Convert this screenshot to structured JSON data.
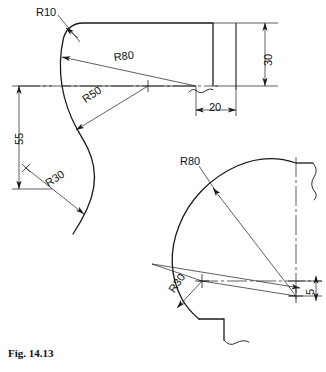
{
  "figure": {
    "caption": "Fig. 14.13",
    "caption_pos": {
      "x": 8,
      "y": 347
    }
  },
  "upper_view": {
    "name": "upper-profile-view",
    "labels": [
      {
        "id": "r10",
        "text": "R10",
        "x": 36,
        "y": 6,
        "rotation": 0
      },
      {
        "id": "r80",
        "text": "R80",
        "x": 113,
        "y": 51,
        "rotation": -7
      },
      {
        "id": "r50",
        "text": "R50",
        "x": 80,
        "y": 95,
        "rotation": -34
      },
      {
        "id": "r30",
        "text": "R30",
        "x": 43,
        "y": 179,
        "rotation": -34
      },
      {
        "id": "dim55",
        "text": "55",
        "x": 13,
        "y": 137,
        "rotation": -90
      },
      {
        "id": "dim30",
        "text": "30",
        "x": 262,
        "y": 66,
        "rotation": -90
      },
      {
        "id": "dim20",
        "text": "20",
        "x": 211,
        "y": 99,
        "rotation": 0
      }
    ]
  },
  "lower_view": {
    "name": "lower-quadrant-view",
    "labels": [
      {
        "id": "r80b",
        "text": "R80",
        "x": 180,
        "y": 155,
        "rotation": 0
      },
      {
        "id": "r30b",
        "text": "R30",
        "x": 168,
        "y": 285,
        "rotation": -56
      },
      {
        "id": "dim5",
        "text": "5",
        "x": 303,
        "y": 296,
        "rotation": -90
      }
    ]
  },
  "style": {
    "line_color": "#1a1a1a",
    "text_color": "#111111",
    "background": "#ffffff",
    "outline_width": 1.3,
    "thin_width": 0.7
  }
}
